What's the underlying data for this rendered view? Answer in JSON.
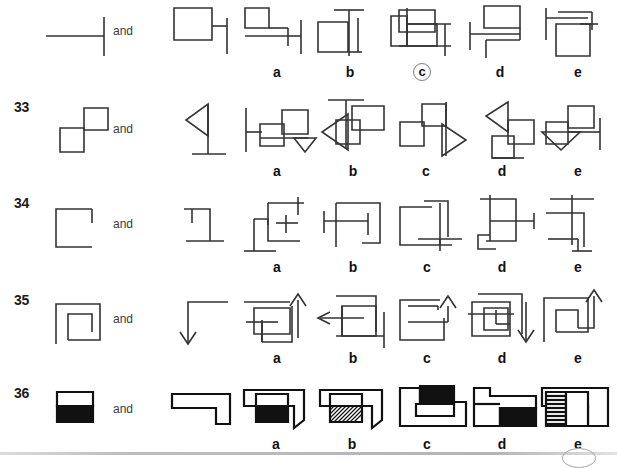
{
  "page": {
    "row_count": 5,
    "options_per_row": 5,
    "and_label": "and",
    "ink_color": "#333333",
    "bold_ink_color": "#111111",
    "fill_black": "#111111",
    "fill_white": "#ffffff",
    "circle_marker_color": "#7d7d7d",
    "background": "#ffffff"
  },
  "rows": [
    {
      "number": "",
      "number_visible": false,
      "and_label": "and",
      "prompt_shapes": [
        {
          "name": "horizontal-line-with-vertical-tick",
          "description": "horizontal line meeting a tall vertical line at its right end"
        }
      ],
      "second_shape": {
        "name": "square-with-right-vertical-tick",
        "description": "square with a short vertical bar off its right side"
      },
      "options": [
        {
          "letter": "a",
          "selected": false,
          "description": "small square upper-left, horizontal line below, vertical tick at right"
        },
        {
          "letter": "b",
          "selected": false,
          "description": "square at left, tall vertical line with top horizontal bar, second vertical line"
        },
        {
          "letter": "c",
          "selected": true,
          "description": "two overlapping rectangles crossed by a vertical line and a horizontal line"
        },
        {
          "letter": "d",
          "selected": false,
          "description": "square top-right, vertical tick at left, step line below"
        },
        {
          "letter": "e",
          "selected": false,
          "description": "square lower-right, horizontal bars and vertical line at top"
        }
      ]
    },
    {
      "number": "33",
      "number_visible": true,
      "and_label": "and",
      "prompt_shapes": [
        {
          "name": "two-diagonal-squares",
          "description": "two small squares joined corner to corner diagonally"
        }
      ],
      "second_shape": {
        "name": "flag-triangle-on-pole",
        "description": "left-pointing triangle flag on a vertical pole with base bar"
      },
      "options": [
        {
          "letter": "a",
          "selected": false,
          "description": "two squares plus vertical line at left and a small down triangle at right"
        },
        {
          "letter": "b",
          "selected": false,
          "description": "two squares with top T-bar and left-pointing triangle"
        },
        {
          "letter": "c",
          "selected": false,
          "description": "two squares with vertical line and right-pointing triangle"
        },
        {
          "letter": "d",
          "selected": false,
          "description": "left-pointing triangle above two squares with base line"
        },
        {
          "letter": "e",
          "selected": false,
          "description": "two squares with down triangle and horizontal bar with vertical tick"
        }
      ]
    },
    {
      "number": "34",
      "number_visible": true,
      "and_label": "and",
      "prompt_shapes": [
        {
          "name": "open-square-gap-top-right",
          "description": "square outline with a gap on the top-right side"
        }
      ],
      "second_shape": {
        "name": "bracket-with-foot",
        "description": "angular bracket shape with a horizontal foot at the bottom"
      },
      "options": [
        {
          "letter": "a",
          "selected": false,
          "description": "nested brackets with top bar, vertical stem and bottom foot"
        },
        {
          "letter": "b",
          "selected": false,
          "description": "H-like bracket inside a partial rectangle"
        },
        {
          "letter": "c",
          "selected": false,
          "description": "two overlapping open brackets, one rotated"
        },
        {
          "letter": "d",
          "selected": false,
          "description": "rectangle split by a horizontal bar with right tick and lower step"
        },
        {
          "letter": "e",
          "selected": false,
          "description": "bracket with top bar, vertical stem and lower left step"
        }
      ]
    },
    {
      "number": "35",
      "number_visible": true,
      "and_label": "and",
      "prompt_shapes": [
        {
          "name": "square-in-square-spiral",
          "description": "square containing a smaller square, open spiral corner"
        }
      ],
      "second_shape": {
        "name": "corner-arrow-down",
        "description": "right-angle line turning down and ending in a downward arrowhead"
      },
      "options": [
        {
          "letter": "a",
          "selected": false,
          "description": "overlapping squares with an up arrow at the right"
        },
        {
          "letter": "b",
          "selected": false,
          "description": "square spiral with a left-pointing arrow"
        },
        {
          "letter": "c",
          "selected": false,
          "description": "open square with an up arrow hooked into its side"
        },
        {
          "letter": "d",
          "selected": false,
          "description": "nested squares with a down arrow at the lower right"
        },
        {
          "letter": "e",
          "selected": false,
          "description": "nested open squares with a tall up arrow at the right"
        }
      ]
    },
    {
      "number": "36",
      "number_visible": true,
      "and_label": "and",
      "prompt_shapes": [
        {
          "name": "rectangle-half-black",
          "description": "rectangle with the top half white and the bottom half solid black"
        }
      ],
      "second_shape": {
        "name": "l-shaped-block",
        "description": "flat L-shaped block outline"
      },
      "options": [
        {
          "letter": "a",
          "selected": false,
          "description": "L-block with an inset rectangle, white top and black bottom"
        },
        {
          "letter": "b",
          "selected": false,
          "description": "L-block with an inset rectangle, white top and hatched bottom"
        },
        {
          "letter": "c",
          "selected": false,
          "description": "stepped block with a solid black rectangle at the top"
        },
        {
          "letter": "d",
          "selected": false,
          "description": "stepped block with solid black lower-right rectangle"
        },
        {
          "letter": "e",
          "selected": false,
          "description": "block with an inset rectangle having horizontal line hatching"
        }
      ]
    }
  ],
  "footer": {
    "rule_visible": true,
    "page_circle_visible": true
  }
}
